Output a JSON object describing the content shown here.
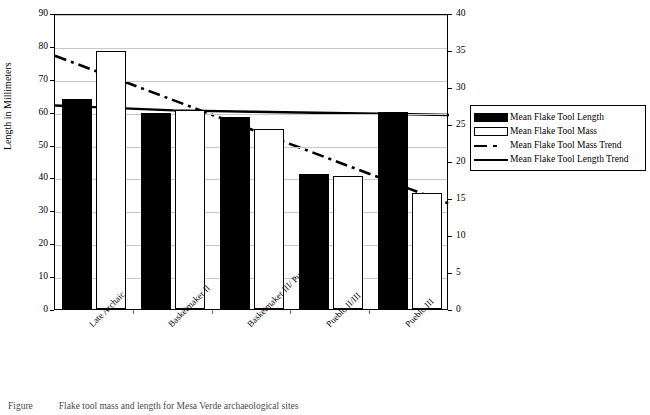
{
  "chart_data": {
    "type": "bar",
    "title": "",
    "categories": [
      "Late Archaic",
      "Basketmaker II",
      "Basketmaker III/ Pueblo I",
      "Pueblo II/III",
      "Pueblo III"
    ],
    "series": [
      {
        "name": "Mean Flake Tool Length",
        "axis": "left",
        "unit": "mm",
        "values": [
          64.0,
          59.5,
          58.4,
          41.0,
          60.0
        ]
      },
      {
        "name": "Mean Flake Tool Mass",
        "axis": "right",
        "unit": "g",
        "values": [
          34.9,
          26.9,
          24.3,
          18.0,
          15.7
        ]
      },
      {
        "name": "Mean Flake Tool Mass Trend",
        "axis": "right",
        "style": "dash-dot",
        "values": [
          32.5,
          28.5,
          24.5,
          20.5,
          16.5
        ]
      },
      {
        "name": "Mean Flake Tool Length Trend",
        "axis": "left",
        "style": "solid",
        "values": [
          62.0,
          61.0,
          60.6,
          60.2,
          59.8
        ]
      }
    ],
    "xlabel": "",
    "ylabel": "Length in Millimeters",
    "ylim": [
      0,
      90
    ],
    "y2lim": [
      0,
      40
    ],
    "yticks": [
      0,
      10,
      20,
      30,
      40,
      50,
      60,
      70,
      80,
      90
    ],
    "y2ticks": [
      0,
      5,
      10,
      15,
      20,
      25,
      30,
      35,
      40
    ],
    "grid": true,
    "legend_position": "right"
  },
  "axes": {
    "left_title": "Length in Millimeters",
    "left_ticks": [
      "0",
      "10",
      "20",
      "30",
      "40",
      "50",
      "60",
      "70",
      "80",
      "90"
    ],
    "right_ticks": [
      "0",
      "5",
      "10",
      "15",
      "20",
      "25",
      "30",
      "35",
      "40"
    ]
  },
  "legend": {
    "items": [
      {
        "label": "Mean Flake Tool Length",
        "marker": "filled-square-swatch"
      },
      {
        "label": "Mean Flake Tool Mass",
        "marker": "open-square-swatch"
      },
      {
        "label": "Mean Flake Tool Mass Trend",
        "marker": "dash-dot-line-swatch"
      },
      {
        "label": "Mean Flake Tool Length Trend",
        "marker": "solid-line-swatch"
      }
    ]
  },
  "caption": {
    "number": "Figure",
    "text": "Flake tool mass and length for Mesa Verde archaeological sites"
  },
  "colors": {
    "bar_length": "#000000",
    "bar_mass": "#ffffff",
    "outline": "#000000",
    "grid": "#c9c9c9"
  }
}
